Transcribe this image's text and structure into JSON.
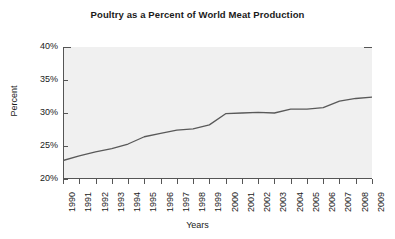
{
  "chart_data": {
    "type": "line",
    "title": "Poultry as a Percent of World Meat Production",
    "xlabel": "Years",
    "ylabel": "Percent",
    "x": [
      1990,
      1991,
      1992,
      1993,
      1994,
      1995,
      1996,
      1997,
      1998,
      1999,
      2000,
      2001,
      2002,
      2003,
      2004,
      2005,
      2006,
      2007,
      2008,
      2009
    ],
    "categories": [
      "1990",
      "1991",
      "1992",
      "1993",
      "1994",
      "1995",
      "1996",
      "1997",
      "1998",
      "1999",
      "2000",
      "2001",
      "2002",
      "2003",
      "2004",
      "2005",
      "2006",
      "2007",
      "2008",
      "2009"
    ],
    "values": [
      22.8,
      23.5,
      24.1,
      24.6,
      25.3,
      26.4,
      26.9,
      27.4,
      27.6,
      28.2,
      29.9,
      30.0,
      30.1,
      30.0,
      30.6,
      30.6,
      30.8,
      31.8,
      32.2,
      32.4
    ],
    "series": [
      {
        "name": "Poultry share of world meat production",
        "values": [
          22.8,
          23.5,
          24.1,
          24.6,
          25.3,
          26.4,
          26.9,
          27.4,
          27.6,
          28.2,
          29.9,
          30.0,
          30.1,
          30.0,
          30.6,
          30.6,
          30.8,
          31.8,
          32.2,
          32.4
        ]
      }
    ],
    "ylim": [
      20,
      40
    ],
    "xlim": [
      1990,
      2009
    ],
    "ytick_labels": [
      "20%",
      "25%",
      "30%",
      "35%",
      "40%"
    ],
    "ytick_values": [
      20,
      25,
      30,
      35,
      40
    ],
    "grid": false,
    "legend": "none",
    "line_color": "#595959",
    "plot_background": "#f0f0f0",
    "axis_color": "#555555",
    "text_color": "#1a1a1a"
  }
}
